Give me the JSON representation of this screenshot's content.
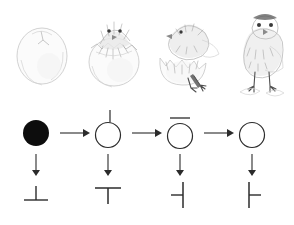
{
  "figure": {
    "caption": "",
    "background_color": "#ffffff",
    "ink_color": "#2b2b2b",
    "sketch_color": "#b9b9b9"
  },
  "illustrations": {
    "row_label": "",
    "items": [
      {
        "name": "intact-egg",
        "label": "",
        "stage": "1",
        "description": "whole egg with small crack at top"
      },
      {
        "name": "chick-head-emerging",
        "label": "",
        "stage": "2",
        "description": "chick head emerging from cracked egg shell"
      },
      {
        "name": "chick-climbing-out",
        "label": "",
        "stage": "3",
        "description": "chick body out of broken shell"
      },
      {
        "name": "hatched-chick-standing",
        "label": "",
        "stage": "4",
        "description": "fully hatched chick standing by shell fragments"
      }
    ]
  },
  "diagram": {
    "states": [
      {
        "name": "filled-circle",
        "label": "",
        "symbol": "filled-circle",
        "marker": "none"
      },
      {
        "name": "circle-with-top-tick",
        "label": "",
        "symbol": "open-circle",
        "marker": "vertical-tick-above"
      },
      {
        "name": "circle-with-top-bar",
        "label": "",
        "symbol": "open-circle",
        "marker": "horizontal-bar-above"
      },
      {
        "name": "open-circle",
        "label": "",
        "symbol": "open-circle",
        "marker": "none"
      }
    ],
    "glyphs": [
      {
        "name": "up-tack",
        "label": "",
        "symbol": "⊥",
        "description": "vertical stroke above horizontal base"
      },
      {
        "name": "down-tack",
        "label": "",
        "symbol": "⊤",
        "description": "horizontal bar above vertical stroke"
      },
      {
        "name": "left-tack",
        "label": "",
        "symbol": "⊣",
        "description": "vertical stroke with left stub"
      },
      {
        "name": "right-tack",
        "label": "",
        "symbol": "⊢",
        "description": "vertical stroke with right stub"
      }
    ],
    "horizontal_arrows": [
      {
        "name": "arrow-1-2",
        "label": "",
        "direction": "right"
      },
      {
        "name": "arrow-2-3",
        "label": "",
        "direction": "right"
      },
      {
        "name": "arrow-3-4",
        "label": "",
        "direction": "right"
      }
    ],
    "vertical_arrows": [
      {
        "name": "arrow-state-1-glyph-1",
        "label": "",
        "direction": "down"
      },
      {
        "name": "arrow-state-2-glyph-2",
        "label": "",
        "direction": "down"
      },
      {
        "name": "arrow-state-3-glyph-3",
        "label": "",
        "direction": "down"
      },
      {
        "name": "arrow-state-4-glyph-4",
        "label": "",
        "direction": "down"
      }
    ]
  }
}
